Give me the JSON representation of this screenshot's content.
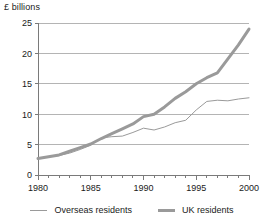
{
  "axis_title": "£ billions",
  "legend": {
    "entries": [
      {
        "label": "Overseas residents",
        "style": "thin",
        "color": "#9a9a9a"
      },
      {
        "label": "UK residents",
        "style": "thick",
        "color": "#9a9a9a"
      }
    ]
  },
  "colors": {
    "line": "#9a9a9a",
    "grid": "#b4b4b4",
    "axis": "#7a7a7a",
    "text": "#1a1a1a",
    "background": "#ffffff"
  },
  "chart_data": {
    "type": "line",
    "title": "",
    "subtitle": "",
    "xlabel": "",
    "ylabel": "£ billions",
    "xlim": [
      1980,
      2000
    ],
    "ylim": [
      0,
      25
    ],
    "grid": true,
    "grid_axis": "y",
    "legend_position": "bottom",
    "yticks": [
      0,
      5,
      10,
      15,
      20,
      25
    ],
    "ytick_labels": [
      "0",
      "5",
      "10",
      "15",
      "20",
      "25"
    ],
    "xticks": [
      1980,
      1985,
      1990,
      1995,
      2000
    ],
    "xtick_labels": [
      "1980",
      "1985",
      "1990",
      "1995",
      "2000"
    ],
    "x_minor_tick_interval": 1,
    "x": [
      1980,
      1981,
      1982,
      1983,
      1984,
      1985,
      1986,
      1987,
      1988,
      1989,
      1990,
      1991,
      1992,
      1993,
      1994,
      1995,
      1996,
      1997,
      1998,
      1999,
      2000
    ],
    "series": [
      {
        "name": "Overseas residents",
        "style": "thin",
        "color": "#9a9a9a",
        "values": [
          2.8,
          3.0,
          3.2,
          3.6,
          4.2,
          4.9,
          6.1,
          6.3,
          6.4,
          7.0,
          7.7,
          7.4,
          7.9,
          8.6,
          9.0,
          10.7,
          12.1,
          12.3,
          12.2,
          12.5,
          12.7
        ]
      },
      {
        "name": "UK residents",
        "style": "thick",
        "color": "#9a9a9a",
        "values": [
          2.7,
          3.0,
          3.3,
          3.9,
          4.5,
          5.1,
          6.0,
          6.8,
          7.6,
          8.4,
          9.6,
          10.0,
          11.2,
          12.6,
          13.7,
          15.0,
          16.0,
          16.8,
          19.1,
          21.4,
          24.0
        ]
      }
    ]
  }
}
